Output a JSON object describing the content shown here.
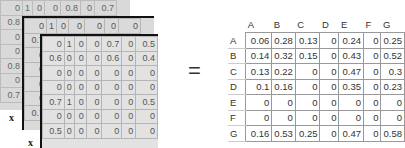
{
  "layers": {
    "back": {
      "rows": [
        [
          "0",
          "1",
          "0",
          "0",
          "0.8",
          "0",
          "0.7"
        ],
        [
          "0.8"
        ],
        [
          "0"
        ],
        [
          "0"
        ],
        [
          "0.8"
        ],
        [
          "0"
        ],
        [
          "0.7"
        ]
      ],
      "label": "x"
    },
    "middle": {
      "rows": [
        [
          "0",
          "1",
          "0",
          "0",
          "0",
          "0",
          "0"
        ],
        [
          "0.7"
        ],
        [
          "0"
        ],
        [
          "0"
        ],
        [
          "0"
        ],
        [
          "0"
        ],
        [
          "0.7"
        ]
      ],
      "label": "x"
    },
    "front": {
      "rows": [
        [
          "0",
          "1",
          "0",
          "0",
          "0.7",
          "0",
          "0.5"
        ],
        [
          "0.6",
          "0",
          "0",
          "0",
          "0.6",
          "0",
          "0.4"
        ],
        [
          "0",
          "0",
          "0",
          "0",
          "0",
          "0",
          "0"
        ],
        [
          "0",
          "0",
          "0",
          "0",
          "0",
          "0",
          "0"
        ],
        [
          "0.7",
          "1",
          "0",
          "0",
          "0",
          "0",
          "0.5"
        ],
        [
          "0",
          "0",
          "0",
          "0",
          "0",
          "0",
          "0"
        ],
        [
          "0.5",
          "0",
          "0",
          "0",
          "0",
          "0",
          "0"
        ]
      ]
    }
  },
  "operator": "=",
  "result": {
    "col_headers": [
      "A",
      "B",
      "C",
      "D",
      "E",
      "F",
      "G"
    ],
    "rows": [
      {
        "label": "A",
        "values": [
          "0.06",
          "0.28",
          "0.13",
          "0",
          "0.24",
          "0",
          "0.25"
        ]
      },
      {
        "label": "B",
        "values": [
          "0.14",
          "0.32",
          "0.15",
          "0",
          "0.43",
          "0",
          "0.52"
        ]
      },
      {
        "label": "C",
        "values": [
          "0.13",
          "0.22",
          "0",
          "0",
          "0.47",
          "0",
          "0.3"
        ]
      },
      {
        "label": "D",
        "values": [
          "0.1",
          "0.16",
          "0",
          "0",
          "0.35",
          "0",
          "0.23"
        ]
      },
      {
        "label": "E",
        "values": [
          "0",
          "0",
          "0",
          "0",
          "0",
          "0",
          "0"
        ]
      },
      {
        "label": "F",
        "values": [
          "0",
          "0",
          "0",
          "0",
          "0",
          "0",
          "0"
        ]
      },
      {
        "label": "G",
        "values": [
          "0.16",
          "0.53",
          "0.25",
          "0",
          "0.47",
          "0",
          "0.58"
        ]
      }
    ]
  }
}
